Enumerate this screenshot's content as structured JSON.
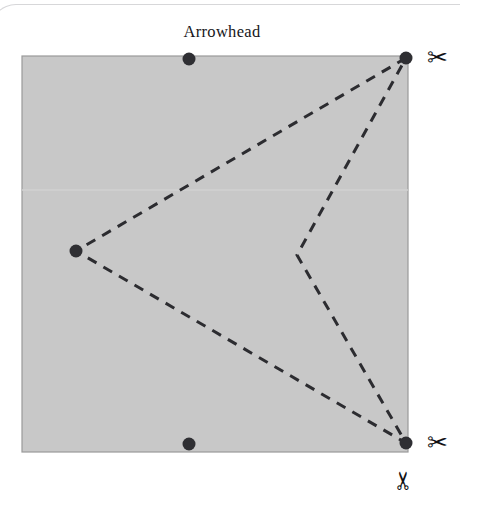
{
  "figure": {
    "title": "Arrowhead",
    "title_x": 222,
    "title_y": 35
  },
  "paper": {
    "name": "folded-square-sheet",
    "fill_color": "#c8c8c8",
    "border_color": "#9a9a9a",
    "x": 22,
    "y": 56,
    "width": 386,
    "height": 396,
    "fold_line_color": "#d2d2d2",
    "fold_line_y": 190
  },
  "crease": {
    "name": "arrowhead-cut-line",
    "stroke_color": "#2c2c30",
    "stroke_width": 3,
    "dash": "10 8",
    "shape_label": "arrowhead",
    "points": [
      {
        "label": "top-right-corner",
        "x": 406,
        "y": 58
      },
      {
        "label": "left-tip",
        "x": 76,
        "y": 251
      },
      {
        "label": "bottom-right-corner",
        "x": 406,
        "y": 443
      },
      {
        "label": "inner-notch",
        "x": 297,
        "y": 255
      }
    ]
  },
  "dots": {
    "color": "#2f2f33",
    "radius": 6.5,
    "items": [
      {
        "label": "dot-top-middle",
        "x": 189,
        "y": 59
      },
      {
        "label": "dot-top-right",
        "x": 406,
        "y": 58
      },
      {
        "label": "dot-left-tip",
        "x": 76,
        "y": 251
      },
      {
        "label": "dot-bottom-middle",
        "x": 189,
        "y": 444
      },
      {
        "label": "dot-bottom-right",
        "x": 406,
        "y": 443
      }
    ]
  },
  "scissors": {
    "glyph": "✂",
    "items": [
      {
        "label": "cut-marker-top-right",
        "x": 427,
        "y": 45,
        "rotation": 0
      },
      {
        "label": "cut-marker-bottom-right",
        "x": 427,
        "y": 430,
        "rotation": 0
      },
      {
        "label": "cut-marker-bottom",
        "x": 393,
        "y": 468,
        "rotation": -90
      }
    ]
  }
}
